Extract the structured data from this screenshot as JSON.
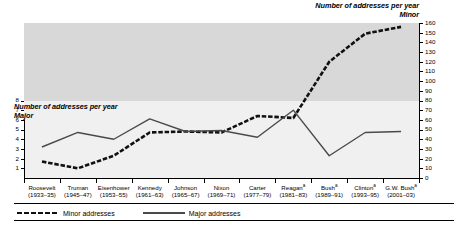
{
  "chart_data": {
    "type": "line",
    "title": "",
    "categories": [
      "Roosevelt",
      "Truman",
      "Eisenhower",
      "Kennedy",
      "Johnson",
      "Nixon",
      "Carter",
      "Reagan",
      "Bush",
      "Clinton",
      "G.W. Bush"
    ],
    "category_years": [
      "(1933–35)",
      "(1945–47)",
      "(1953–55)",
      "(1961–63)",
      "(1965–67)",
      "(1969–71)",
      "(1977–79)",
      "(1981–83)",
      "(1989–91)",
      "(1993–95)",
      "(2001–03)"
    ],
    "category_footnotes": [
      "",
      "",
      "",
      "",
      "",
      "",
      "",
      "a",
      "a",
      "a",
      "a"
    ],
    "series": [
      {
        "name": "Minor addresses",
        "axis": "right",
        "style": "dashed",
        "values": [
          17,
          10,
          23,
          47,
          48,
          47,
          64,
          62,
          120,
          149,
          156
        ]
      },
      {
        "name": "Major addresses",
        "axis": "left",
        "style": "solid",
        "values": [
          3.2,
          4.7,
          4.0,
          6.1,
          4.8,
          4.9,
          4.2,
          7.0,
          2.3,
          4.7,
          4.8
        ]
      }
    ],
    "left_axis": {
      "title_line1": "Number of addresses per year",
      "title_line2": "Major",
      "ticks": [
        8,
        7,
        6,
        5,
        4,
        3,
        2,
        1
      ],
      "lim": [
        0,
        16
      ]
    },
    "right_axis": {
      "title_line1": "Number of addresses per year",
      "title_line2": "Minor",
      "ticks": [
        160,
        150,
        140,
        130,
        120,
        110,
        100,
        90,
        80,
        70,
        60,
        50,
        40,
        30,
        20,
        10,
        0
      ],
      "lim": [
        0,
        160
      ]
    },
    "legend": {
      "position": "bottom-left",
      "entries": [
        "Minor addresses",
        "Major addresses"
      ]
    },
    "grid": false,
    "xlabel": "",
    "ylabel": "Number of addresses per year"
  },
  "colors": {
    "band_upper": "#d8d8d8",
    "band_lower": "#f0f0f0",
    "minor_line": "#111111",
    "major_line": "#4a4a4a",
    "axis": "#000000"
  }
}
